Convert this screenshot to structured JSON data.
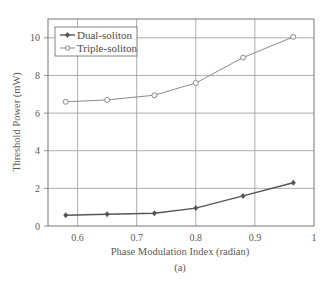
{
  "chart_data": {
    "type": "line",
    "title": "",
    "xlabel": "Phase Modulation Index (radian)",
    "ylabel": "Threshold Power (mW)",
    "caption": "(a)",
    "xlim": [
      0.55,
      1.0
    ],
    "ylim": [
      0,
      11
    ],
    "xticks": [
      0.6,
      0.7,
      0.8,
      0.9,
      1
    ],
    "xtick_labels": [
      "0.6",
      "0.7",
      "0.8",
      "0.9",
      "1"
    ],
    "yticks": [
      0,
      2,
      4,
      6,
      8,
      10
    ],
    "ytick_labels": [
      "0",
      "2",
      "4",
      "6",
      "8",
      "10"
    ],
    "grid": true,
    "legend_position": "upper left",
    "x": [
      0.58,
      0.65,
      0.73,
      0.8,
      0.88,
      0.965
    ],
    "series": [
      {
        "name": "Dual-soliton",
        "marker": "filled-diamond",
        "color": "#555555",
        "values": [
          0.57,
          0.62,
          0.68,
          0.95,
          1.6,
          2.3
        ]
      },
      {
        "name": "Triple-soliton",
        "marker": "open-circle",
        "color": "#8a8a8a",
        "values": [
          6.6,
          6.7,
          6.95,
          7.6,
          8.95,
          10.05
        ]
      }
    ]
  },
  "legend": {
    "items": [
      "Dual-soliton",
      "Triple-soliton"
    ]
  }
}
